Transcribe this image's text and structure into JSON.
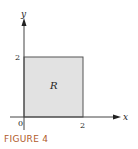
{
  "diagram": {
    "region_label": "R",
    "x_axis_label": "x",
    "y_axis_label": "y",
    "origin_label": "0",
    "x_tick_label": "2",
    "y_tick_label": "2",
    "region_fill": "#e2e2e2",
    "region_stroke": "#555555"
  },
  "caption": "FIGURE 4"
}
